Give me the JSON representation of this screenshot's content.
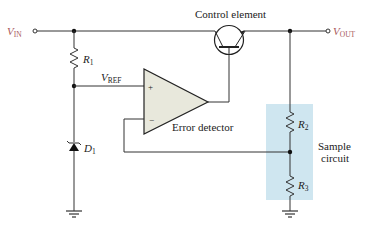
{
  "diagram": {
    "type": "series voltage regulator block diagram",
    "labels": {
      "vin": {
        "main": "V",
        "sub": "IN"
      },
      "vout": {
        "main": "V",
        "sub": "OUT"
      },
      "vref": {
        "main": "V",
        "sub": "REF"
      },
      "r1": {
        "main": "R",
        "sub": "1"
      },
      "r2": {
        "main": "R",
        "sub": "2"
      },
      "r3": {
        "main": "R",
        "sub": "3"
      },
      "d1": {
        "main": "D",
        "sub": "1"
      },
      "control_element": "Control element",
      "error_detector": "Error detector",
      "sample_circuit_line1": "Sample",
      "sample_circuit_line2": "circuit",
      "plus": "+",
      "minus": "−"
    },
    "colors": {
      "terminal_label": "#a8585a",
      "sample_box": "#cfe6f0",
      "opamp_fill": "#e8e8dc",
      "wire": "#333333"
    }
  }
}
